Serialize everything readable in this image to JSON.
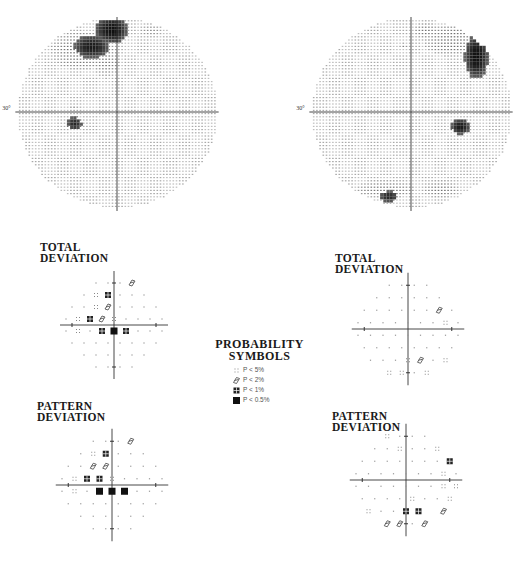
{
  "figure": {
    "grayscale_maps": [
      {
        "id": "left-grayscale",
        "eccentricity_label": "30°",
        "eye": "left"
      },
      {
        "id": "right-grayscale",
        "eccentricity_label": "30°",
        "eye": "right"
      }
    ],
    "legend": {
      "title_line1": "PROBABILITY",
      "title_line2": "SYMBOLS",
      "items": [
        {
          "code": "a",
          "label": "P < 5%"
        },
        {
          "code": "b",
          "label": "P < 2%"
        },
        {
          "code": "c",
          "label": "P < 1%"
        },
        {
          "code": "d",
          "label": "P < 0.5%"
        }
      ]
    },
    "plots": [
      {
        "id": "left-total",
        "title_line1": "TOTAL",
        "title_line2": "DEVIATION",
        "rows": [
          "...b",
          ".ac...",
          "..ab....",
          ".acba....",
          ".a.cdc...",
          "........",
          "......",
          "...."
        ]
      },
      {
        "id": "left-pattern",
        "title_line1": "PATTERN",
        "title_line2": "DEVIATION",
        "rows": [
          "...b",
          ".ac...",
          "..bb....",
          ".acca....",
          ".a.ddd...",
          "........",
          "......",
          "...."
        ]
      },
      {
        "id": "right-total",
        "title_line1": "TOTAL",
        "title_line2": "DEVIATION",
        "rows": [
          "....",
          "......",
          "......b.",
          ".......a.",
          ".........",
          "........",
          "...ab.a",
          "aa.a"
        ]
      },
      {
        "id": "right-pattern",
        "title_line1": "PATTERN",
        "title_line2": "DEVIATION",
        "rows": [
          "a...",
          "..a..a",
          ".......c",
          ".......a.",
          ".......aa",
          "....a..a",
          "a..cc b",
          "bb.b"
        ]
      }
    ]
  }
}
